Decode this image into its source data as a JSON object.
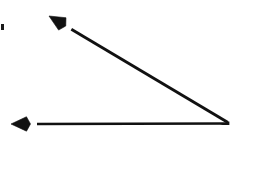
{
  "figure": {
    "type": "geometry-angle-diagram",
    "canvas": {
      "width": 259,
      "height": 177,
      "background": "#ffffff"
    },
    "stroke_color": "#111111",
    "vertex": {
      "label": "",
      "x": 228,
      "y": 123
    },
    "angle_measure_degrees": 34,
    "rays": [
      {
        "name": "horizontal-ray",
        "description": "Ray pointing left from the vertex",
        "from": {
          "x": 228,
          "y": 123.5
        },
        "to": {
          "x": 11,
          "y": 124
        },
        "arrowhead": "barbed",
        "stroke_width": 2.4
      },
      {
        "name": "diagonal-ray",
        "description": "Ray pointing up and to the left from the vertex",
        "from": {
          "x": 228,
          "y": 122.5
        },
        "to": {
          "x": 49,
          "y": 16
        },
        "arrowhead": "barbed",
        "stroke_width": 2.9
      }
    ],
    "artifacts": [
      {
        "name": "scan-speck",
        "x": 1,
        "y": 24,
        "width": 3,
        "height": 6,
        "color": "#1a1a1a"
      }
    ],
    "labels": []
  }
}
